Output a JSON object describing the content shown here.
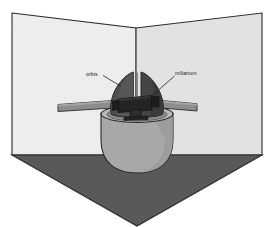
{
  "diagram": {
    "labels": {
      "left": "orbis",
      "right": "miliarium"
    },
    "parts": [
      {
        "name": "orbis",
        "description": "dark curved shell/hemisphere halves rising from the basin"
      },
      {
        "name": "miliarium",
        "description": "dark central gnomon block mounted inside the basin"
      },
      {
        "name": "basin",
        "description": "light gray hemispherical bowl"
      },
      {
        "name": "crossbar",
        "description": "horizontal gray bar passing through the assembly"
      }
    ],
    "colors": {
      "background": "#ffffff",
      "wall_left": "#ededed",
      "wall_right": "#e2e2e2",
      "floor": "#595959",
      "basin": "#a8a8a8",
      "basin_shadow": "#8f8f8f",
      "basin_rim": "#b4b4b4",
      "shell_dark": "#4a4a4a",
      "shell_darker": "#3d3d3d",
      "gnomon": "#242424",
      "crossbar": "#8d8d8d",
      "crossbar_edge": "#6f6f6f",
      "outline": "#2b2b2b",
      "label_text": "#1a1a1a",
      "leader_line": "#1a1a1a"
    },
    "geometry": {
      "canvas": {
        "width": 270,
        "height": 227
      },
      "wall_left_points": "12,13 136,28 136,155 12,155",
      "wall_right_points": "136,28 262,13 262,155 136,155",
      "floor_points": "12,155 262,155 137,226",
      "corner_line": {
        "x": 136,
        "y_top": 28,
        "y_bottom": 155
      },
      "crossbar": {
        "x_left": 58,
        "x_right": 197,
        "y": 104,
        "thickness": 7
      },
      "basin_center_x": 137,
      "basin_rim_y": 118,
      "basin_bottom_y": 172
    }
  }
}
